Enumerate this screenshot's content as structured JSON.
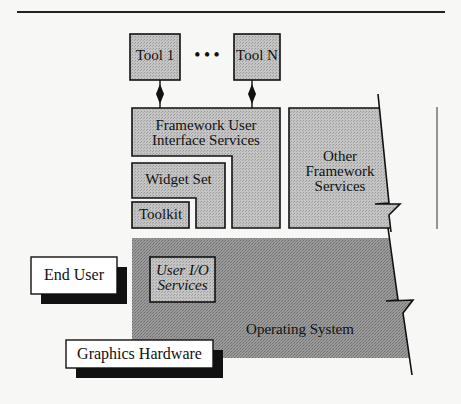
{
  "diagram": {
    "type": "layered-architecture",
    "nodes": {
      "tool_1": {
        "label": "Tool 1"
      },
      "ellipsis": {
        "label": "• • •"
      },
      "tool_n": {
        "label": "Tool N"
      },
      "framework_ui": {
        "line1": "Framework User",
        "line2": "Interface Services"
      },
      "widget_set": {
        "label": "Widget Set"
      },
      "toolkit": {
        "label": "Toolkit"
      },
      "other_framework": {
        "line1": "Other",
        "line2": "Framework",
        "line3": "Services"
      },
      "user_io": {
        "line1": "User I/O",
        "line2": "Services"
      },
      "operating_system": {
        "label": "Operating System"
      },
      "end_user": {
        "label": "End User"
      },
      "graphics_hardware": {
        "label": "Graphics Hardware"
      }
    },
    "edges": [
      {
        "from": "tool_1",
        "to": "framework_ui",
        "style": "bidirectional-diamond"
      },
      {
        "from": "tool_n",
        "to": "framework_ui",
        "style": "bidirectional-diamond"
      }
    ],
    "colors": {
      "light_fill": "#b8b8b8",
      "dark_fill": "#8e8e8e",
      "stroke": "#111111",
      "shadow": "#111111",
      "box_white": "#ffffff"
    }
  }
}
